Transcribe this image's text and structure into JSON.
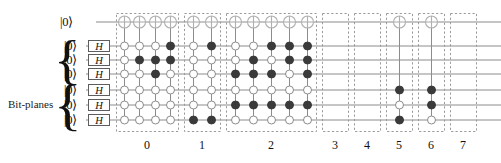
{
  "figure": {
    "kind": "quantum-circuit-diagram",
    "bitplanes_label": "Bit-planes",
    "top_qubit_label": "|0⟩",
    "gate_label": "H",
    "wire_color": "#8c8c8c",
    "box_border_color": "#9a9a9a",
    "filled_dot_color": "#3a3a3a",
    "open_dot_color": "#ffffff",
    "open_dot_stroke": "#8c8c8c",
    "target_stroke": "#b0b0b0"
  },
  "wires": {
    "count": 7,
    "labels": [
      "|0⟩",
      "|0⟩",
      "|0⟩",
      "|0⟩",
      "|0⟩",
      "|0⟩",
      "|0⟩"
    ],
    "gate_rows": [
      1,
      2,
      3,
      4,
      5,
      6
    ],
    "gate_labels": [
      "H",
      "H",
      "H",
      "H",
      "H",
      "H"
    ],
    "target_row": 0
  },
  "braces": [
    {
      "name": "upper-bitplane-brace",
      "rows": [
        1,
        2,
        3
      ]
    },
    {
      "name": "lower-bitplane-brace",
      "rows": [
        4,
        5,
        6
      ]
    }
  ],
  "groups": [
    {
      "label": "0",
      "columns": [
        {
          "target": true,
          "dots": [
            {
              "row": 3,
              "fill": "open"
            },
            {
              "row": 2,
              "fill": "open"
            },
            {
              "row": 1,
              "fill": "open"
            },
            {
              "row": 4,
              "fill": "open"
            },
            {
              "row": 5,
              "fill": "open"
            },
            {
              "row": 6,
              "fill": "open"
            }
          ]
        },
        {
          "target": true,
          "dots": [
            {
              "row": 1,
              "fill": "open"
            },
            {
              "row": 2,
              "fill": "filled"
            },
            {
              "row": 3,
              "fill": "open"
            },
            {
              "row": 4,
              "fill": "open"
            },
            {
              "row": 5,
              "fill": "open"
            },
            {
              "row": 6,
              "fill": "open"
            }
          ]
        },
        {
          "target": true,
          "dots": [
            {
              "row": 1,
              "fill": "open"
            },
            {
              "row": 2,
              "fill": "filled"
            },
            {
              "row": 3,
              "fill": "filled"
            },
            {
              "row": 4,
              "fill": "open"
            },
            {
              "row": 5,
              "fill": "open"
            },
            {
              "row": 6,
              "fill": "open"
            }
          ]
        },
        {
          "target": true,
          "dots": [
            {
              "row": 1,
              "fill": "filled"
            },
            {
              "row": 2,
              "fill": "filled"
            },
            {
              "row": 3,
              "fill": "open"
            },
            {
              "row": 4,
              "fill": "open"
            },
            {
              "row": 5,
              "fill": "open"
            },
            {
              "row": 6,
              "fill": "open"
            }
          ]
        }
      ]
    },
    {
      "label": "1",
      "columns": [
        {
          "target": true,
          "dots": [
            {
              "row": 1,
              "fill": "open"
            },
            {
              "row": 2,
              "fill": "open"
            },
            {
              "row": 3,
              "fill": "open"
            },
            {
              "row": 4,
              "fill": "open"
            },
            {
              "row": 5,
              "fill": "open"
            },
            {
              "row": 6,
              "fill": "filled"
            }
          ]
        },
        {
          "target": true,
          "dots": [
            {
              "row": 1,
              "fill": "filled"
            },
            {
              "row": 2,
              "fill": "open"
            },
            {
              "row": 3,
              "fill": "open"
            },
            {
              "row": 4,
              "fill": "open"
            },
            {
              "row": 5,
              "fill": "open"
            },
            {
              "row": 6,
              "fill": "filled"
            }
          ]
        }
      ]
    },
    {
      "label": "2",
      "columns": [
        {
          "target": true,
          "dots": [
            {
              "row": 1,
              "fill": "open"
            },
            {
              "row": 2,
              "fill": "open"
            },
            {
              "row": 3,
              "fill": "filled"
            },
            {
              "row": 4,
              "fill": "open"
            },
            {
              "row": 5,
              "fill": "filled"
            },
            {
              "row": 6,
              "fill": "open"
            }
          ]
        },
        {
          "target": true,
          "dots": [
            {
              "row": 1,
              "fill": "open"
            },
            {
              "row": 2,
              "fill": "filled"
            },
            {
              "row": 3,
              "fill": "filled"
            },
            {
              "row": 4,
              "fill": "open"
            },
            {
              "row": 5,
              "fill": "filled"
            },
            {
              "row": 6,
              "fill": "open"
            }
          ]
        },
        {
          "target": true,
          "dots": [
            {
              "row": 1,
              "fill": "filled"
            },
            {
              "row": 2,
              "fill": "open"
            },
            {
              "row": 3,
              "fill": "filled"
            },
            {
              "row": 4,
              "fill": "open"
            },
            {
              "row": 5,
              "fill": "filled"
            },
            {
              "row": 6,
              "fill": "open"
            }
          ]
        },
        {
          "target": true,
          "dots": [
            {
              "row": 1,
              "fill": "filled"
            },
            {
              "row": 2,
              "fill": "filled"
            },
            {
              "row": 3,
              "fill": "open"
            },
            {
              "row": 4,
              "fill": "open"
            },
            {
              "row": 5,
              "fill": "filled"
            },
            {
              "row": 6,
              "fill": "open"
            }
          ]
        },
        {
          "target": true,
          "dots": [
            {
              "row": 1,
              "fill": "filled"
            },
            {
              "row": 2,
              "fill": "filled"
            },
            {
              "row": 3,
              "fill": "filled"
            },
            {
              "row": 4,
              "fill": "open"
            },
            {
              "row": 5,
              "fill": "filled"
            },
            {
              "row": 6,
              "fill": "open"
            }
          ]
        }
      ]
    },
    {
      "label": "3",
      "columns": []
    },
    {
      "label": "4",
      "columns": []
    },
    {
      "label": "5",
      "columns": [
        {
          "target": true,
          "dots": [
            {
              "row": 4,
              "fill": "filled"
            },
            {
              "row": 5,
              "fill": "open"
            },
            {
              "row": 6,
              "fill": "filled"
            }
          ]
        }
      ]
    },
    {
      "label": "6",
      "columns": [
        {
          "target": true,
          "dots": [
            {
              "row": 4,
              "fill": "filled"
            },
            {
              "row": 5,
              "fill": "filled"
            },
            {
              "row": 6,
              "fill": "open"
            }
          ]
        }
      ]
    },
    {
      "label": "7",
      "columns": []
    }
  ],
  "geometry": {
    "row_y": [
      22,
      46,
      60,
      74,
      90,
      105,
      120
    ],
    "wire_x_start": 86,
    "wire_x_end": 501,
    "group_boxes": [
      {
        "x": 116,
        "w": 62
      },
      {
        "x": 184,
        "w": 36
      },
      {
        "x": 226,
        "w": 90
      },
      {
        "x": 322,
        "w": 26
      },
      {
        "x": 354,
        "w": 26
      },
      {
        "x": 386,
        "w": 26
      },
      {
        "x": 418,
        "w": 26
      },
      {
        "x": 450,
        "w": 26
      }
    ],
    "box_top": 13,
    "box_bottom": 131,
    "dot_radius": 4.0,
    "target_radius": 6.0,
    "label_y": 138
  }
}
